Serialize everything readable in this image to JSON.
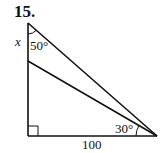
{
  "problem": {
    "number": "15."
  },
  "diagram": {
    "labels": {
      "unknown_side": "x",
      "top_angle": "50°",
      "bottom_right_angle": "30°",
      "base_length": "100"
    },
    "vertices": {
      "top": [
        28,
        23
      ],
      "right_angle_corner": [
        28,
        136
      ],
      "inner_point": [
        28,
        61
      ],
      "bottom_right": [
        157,
        136
      ]
    },
    "stroke_color": "#111111"
  }
}
